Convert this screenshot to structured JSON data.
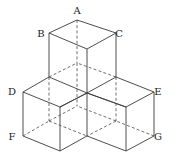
{
  "diagram": {
    "title": "",
    "labels": [
      {
        "text": "A",
        "x": 77,
        "y": 14
      },
      {
        "text": "B",
        "x": 41,
        "y": 37
      },
      {
        "text": "C",
        "x": 119,
        "y": 37
      },
      {
        "text": "D",
        "x": 12,
        "y": 95
      },
      {
        "text": "E",
        "x": 158,
        "y": 95
      },
      {
        "text": "F",
        "x": 12,
        "y": 140
      },
      {
        "text": "G",
        "x": 158,
        "y": 140
      }
    ],
    "line_color": "#3a3a3a",
    "background": "#ffffff"
  }
}
